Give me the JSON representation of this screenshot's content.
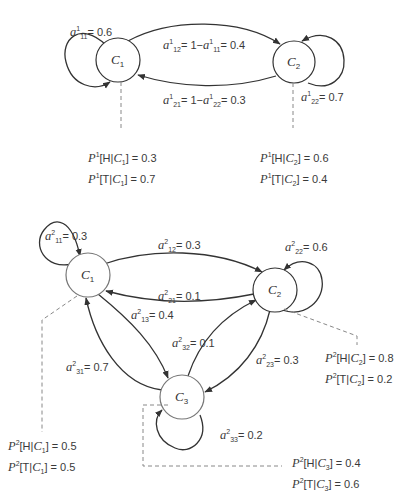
{
  "diagram": {
    "model_1": {
      "states": [
        {
          "id": "C1",
          "label": "C",
          "sub": "1"
        },
        {
          "id": "C2",
          "label": "C",
          "sub": "2"
        }
      ],
      "transitions": {
        "a11": {
          "sup": "1",
          "sub": "11",
          "text": "= 0.6"
        },
        "a12": {
          "sup": "1",
          "sub": "12",
          "text": "= 1−",
          "sup2": "1",
          "sub2": "11",
          "text2": "= 0.4"
        },
        "a21": {
          "sup": "1",
          "sub": "21",
          "text": "= 1−",
          "sup2": "1",
          "sub2": "22",
          "text2": "= 0.3"
        },
        "a22": {
          "sup": "1",
          "sub": "22",
          "text": "= 0.7"
        }
      },
      "emissions": {
        "C1": {
          "sup": "1",
          "H": "[H|",
          "T": "[T|",
          "sub": "1",
          "pH": "] = 0.3",
          "pT": "] = 0.7"
        },
        "C2": {
          "sup": "1",
          "H": "[H|",
          "T": "[T|",
          "sub": "2",
          "pH": "] = 0.6",
          "pT": "] = 0.4"
        }
      }
    },
    "model_2": {
      "states": [
        {
          "id": "C1",
          "label": "C",
          "sub": "1"
        },
        {
          "id": "C2",
          "label": "C",
          "sub": "2"
        },
        {
          "id": "C3",
          "label": "C",
          "sub": "3"
        }
      ],
      "transitions": {
        "a11": {
          "sup": "2",
          "sub": "11",
          "text": "= 0.3"
        },
        "a12": {
          "sup": "2",
          "sub": "12",
          "text": "= 0.3"
        },
        "a21": {
          "sup": "2",
          "sub": "21",
          "text": "= 0.1"
        },
        "a22": {
          "sup": "2",
          "sub": "22",
          "text": "= 0.6"
        },
        "a13": {
          "sup": "2",
          "sub": "13",
          "text": "= 0.4"
        },
        "a32": {
          "sup": "2",
          "sub": "32",
          "text": "= 0.1"
        },
        "a23": {
          "sup": "2",
          "sub": "23",
          "text": "= 0.3"
        },
        "a31": {
          "sup": "2",
          "sub": "31",
          "text": "= 0.7"
        },
        "a33": {
          "sup": "2",
          "sub": "33",
          "text": "= 0.2"
        }
      },
      "emissions": {
        "C1": {
          "sup": "2",
          "H": "[H|",
          "T": "[T|",
          "sub": "1",
          "pH": "] = 0.5",
          "pT": "] = 0.5"
        },
        "C2": {
          "sup": "2",
          "H": "[H|",
          "T": "[T|",
          "sub": "2",
          "pH": "] = 0.8",
          "pT": "] = 0.2"
        },
        "C3": {
          "sup": "2",
          "H": "[H|",
          "T": "[T|",
          "sub": "3",
          "pH": "] = 0.4",
          "pT": "] = 0.6"
        }
      }
    },
    "symbols": {
      "a": "a",
      "P": "P"
    }
  }
}
